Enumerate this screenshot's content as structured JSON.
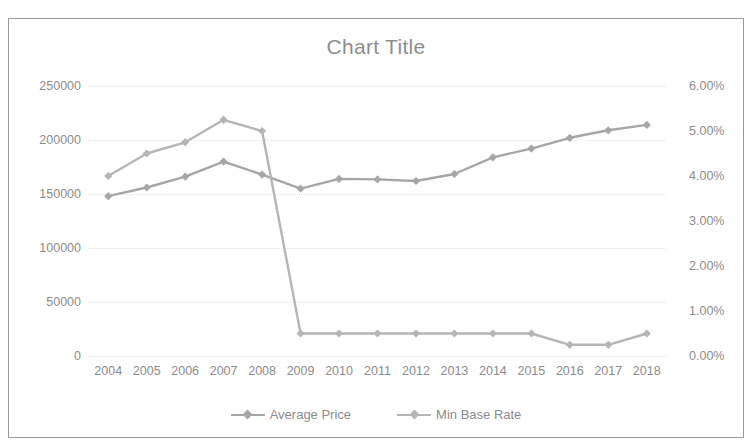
{
  "top_strip_text": "",
  "chart_frame": {
    "border_color": "#9a9a9a"
  },
  "legend": {
    "items": [
      {
        "label": "Average Price",
        "color": "#a6a6a6"
      },
      {
        "label": "Min Base Rate",
        "color": "#b5b5b5"
      }
    ]
  },
  "chart_data": {
    "type": "line",
    "title": "Chart Title",
    "xlabel": "",
    "ylabel": "",
    "grid": true,
    "legend_position": "bottom",
    "categories": [
      "2004",
      "2005",
      "2006",
      "2007",
      "2008",
      "2009",
      "2010",
      "2011",
      "2012",
      "2013",
      "2014",
      "2015",
      "2016",
      "2017",
      "2018"
    ],
    "axes": {
      "left": {
        "ticks": [
          0,
          50000,
          100000,
          150000,
          200000,
          250000
        ],
        "tick_labels": [
          "0",
          "50000",
          "100000",
          "150000",
          "200000",
          "250000"
        ],
        "ylim": [
          0,
          250000
        ],
        "series": "Average Price"
      },
      "right": {
        "ticks": [
          0,
          1,
          2,
          3,
          4,
          5,
          6
        ],
        "tick_labels": [
          "0.00%",
          "1.00%",
          "2.00%",
          "3.00%",
          "4.00%",
          "5.00%",
          "6.00%"
        ],
        "ylim": [
          0,
          6
        ],
        "series": "Min Base Rate"
      }
    },
    "series": [
      {
        "name": "Average Price",
        "axis": "left",
        "color": "#a6a6a6",
        "marker": "diamond",
        "values": [
          148000,
          156000,
          166000,
          180000,
          168000,
          155000,
          164000,
          163500,
          162000,
          168500,
          184000,
          192000,
          202000,
          209000,
          214000
        ]
      },
      {
        "name": "Min Base Rate",
        "axis": "right",
        "color": "#b5b5b5",
        "marker": "diamond",
        "values": [
          4.0,
          4.5,
          4.75,
          5.25,
          5.0,
          0.5,
          0.5,
          0.5,
          0.5,
          0.5,
          0.5,
          0.5,
          0.25,
          0.25,
          0.5
        ]
      }
    ]
  }
}
